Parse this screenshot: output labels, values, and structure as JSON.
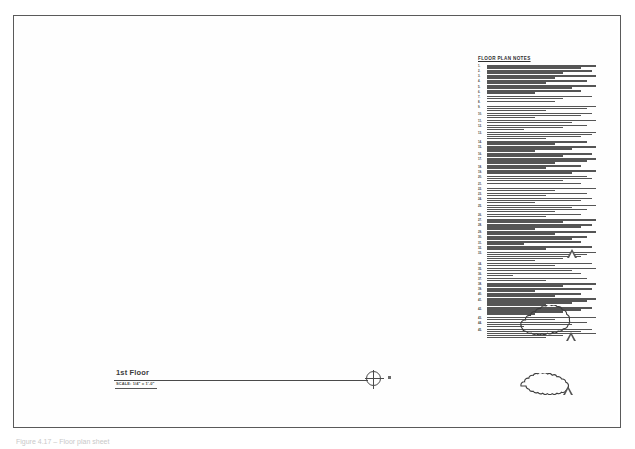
{
  "sheet": {
    "background_color": "#ffffff",
    "border_color": "#5a5a5a",
    "caption": "Figure 4.17 – Floor plan sheet"
  },
  "plan": {
    "title": "1st Floor",
    "scale": "SCALE: 1/4\" = 1'-0\"",
    "datum_icon": "crosshair-circle-icon",
    "datum_tick_icon": "square-tick-icon"
  },
  "notes": {
    "heading": "FLOOR PLAN NOTES",
    "items": [
      {
        "number": "1.",
        "lines": [
          "w100",
          "w86"
        ]
      },
      {
        "number": "2.",
        "lines": [
          "w96",
          "w70"
        ]
      },
      {
        "number": "3.",
        "lines": [
          "w100",
          "w62"
        ]
      },
      {
        "number": "4.",
        "lines": [
          "w92",
          "w54"
        ]
      },
      {
        "number": "5.",
        "lines": [
          "w100",
          "w78"
        ]
      },
      {
        "number": "6.",
        "lines": [
          "w86",
          "w44"
        ]
      },
      {
        "number": "7.",
        "lines": [
          "w96",
          "w70"
        ]
      },
      {
        "number": "8.",
        "lines": [
          "w62"
        ]
      },
      {
        "number": "9.",
        "lines": [
          "w100",
          "w92",
          "w54"
        ]
      },
      {
        "number": "10.",
        "lines": [
          "w96",
          "w86",
          "w44"
        ]
      },
      {
        "number": "11.",
        "lines": [
          "w100",
          "w78"
        ]
      },
      {
        "number": "12.",
        "lines": [
          "w92",
          "w70",
          "w34"
        ]
      },
      {
        "number": "13.",
        "lines": [
          "w100",
          "w96",
          "w86",
          "w54"
        ]
      },
      {
        "number": "14.",
        "lines": [
          "w92",
          "w62"
        ]
      },
      {
        "number": "15.",
        "lines": [
          "w100",
          "w78",
          "w44"
        ]
      },
      {
        "number": "16.",
        "lines": [
          "w96",
          "w70"
        ]
      },
      {
        "number": "17.",
        "lines": [
          "w100",
          "w92",
          "w62"
        ]
      },
      {
        "number": "18.",
        "lines": [
          "w86",
          "w54"
        ]
      },
      {
        "number": "19.",
        "lines": [
          "w100",
          "w78"
        ]
      },
      {
        "number": "20.",
        "lines": [
          "w92",
          "w96",
          "w70"
        ]
      },
      {
        "number": "21.",
        "lines": [
          "w86"
        ]
      },
      {
        "number": "22.",
        "lines": [
          "w100",
          "w62"
        ]
      },
      {
        "number": "23.",
        "lines": [
          "w92",
          "w54"
        ]
      },
      {
        "number": "24.",
        "lines": [
          "w96",
          "w86",
          "w44"
        ]
      },
      {
        "number": "25.",
        "lines": [
          "w100",
          "w78",
          "w92",
          "w62"
        ]
      },
      {
        "number": "26.",
        "lines": [
          "w86",
          "w54"
        ]
      },
      {
        "number": "27.",
        "lines": [
          "w100",
          "w70"
        ]
      },
      {
        "number": "28.",
        "lines": [
          "w96",
          "w86",
          "w44"
        ]
      },
      {
        "number": "29.",
        "lines": [
          "w100",
          "w62"
        ]
      },
      {
        "number": "30.",
        "lines": [
          "w92",
          "w78"
        ]
      },
      {
        "number": "31.",
        "lines": [
          "w86",
          "w34"
        ]
      },
      {
        "number": "32.",
        "lines": [
          "w96",
          "w54"
        ]
      },
      {
        "number": "33.",
        "lines": [
          "w100",
          "w92",
          "w86",
          "w70",
          "w44"
        ]
      },
      {
        "number": "34.",
        "lines": [
          "w96",
          "w62"
        ]
      },
      {
        "number": "35.",
        "lines": [
          "w100",
          "w78"
        ]
      },
      {
        "number": "36.",
        "lines": [
          "w86",
          "w24"
        ]
      },
      {
        "number": "37.",
        "lines": [
          "w92",
          "w54"
        ]
      },
      {
        "number": "38.",
        "lines": [
          "w100",
          "w70"
        ]
      },
      {
        "number": "39.",
        "lines": [
          "w96",
          "w44"
        ]
      },
      {
        "number": "40.",
        "lines": [
          "w86",
          "w62"
        ]
      },
      {
        "number": "41.",
        "lines": [
          "w100",
          "w92",
          "w78",
          "w54"
        ]
      },
      {
        "number": "42.",
        "lines": [
          "w96",
          "w86",
          "w70",
          "w44"
        ]
      },
      {
        "number": "43.",
        "lines": [
          "w100",
          "w62"
        ]
      },
      {
        "number": "44.",
        "lines": [
          "w92",
          "w78",
          "w34"
        ]
      },
      {
        "number": "45.",
        "lines": [
          "w96",
          "w86",
          "w100",
          "w70",
          "w54"
        ]
      }
    ]
  },
  "revisions": {
    "delta_markers": [
      {
        "name": "revision-delta-1",
        "label": "1"
      },
      {
        "name": "revision-delta-2",
        "label": "1"
      },
      {
        "name": "revision-delta-3",
        "label": "1"
      }
    ],
    "clouds": [
      {
        "name": "revision-cloud-1"
      },
      {
        "name": "revision-cloud-2"
      }
    ]
  }
}
